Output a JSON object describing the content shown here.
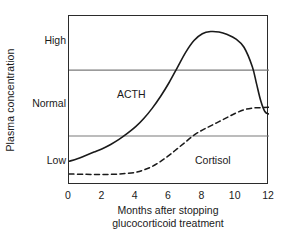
{
  "chart_data": {
    "type": "line",
    "title": "",
    "xlabel_lines": [
      "Months after stopping",
      "glucocorticoid treatment"
    ],
    "ylabel": "Plasma concentration",
    "xlim": [
      0,
      12
    ],
    "xticks": [
      0,
      2,
      4,
      6,
      8,
      10,
      12
    ],
    "xtick_labels": [
      "0",
      "2",
      "4",
      "6",
      "8",
      "10",
      "12"
    ],
    "ytick_labels": [
      "High",
      "Normal",
      "Low"
    ],
    "ytick_values": [
      0.85,
      0.5,
      0.14
    ],
    "ylim": [
      0,
      1
    ],
    "grid": "horizontal",
    "gridlines": [
      0.68,
      0.29
    ],
    "gridline_labels": [
      "upper-normal-limit",
      "lower-normal-limit"
    ],
    "legend_position": "inline-annotation",
    "series": [
      {
        "name": "ACTH",
        "style": "solid",
        "color": "#1a1a1a",
        "x": [
          0,
          0.5,
          1,
          1.5,
          2,
          2.5,
          3,
          3.5,
          4,
          4.5,
          5,
          5.5,
          6,
          6.5,
          7,
          7.5,
          8,
          8.5,
          9,
          9.5,
          10,
          10.5,
          11,
          11.25,
          11.5,
          11.75,
          12
        ],
        "y": [
          0.14,
          0.155,
          0.175,
          0.195,
          0.215,
          0.24,
          0.27,
          0.305,
          0.345,
          0.395,
          0.455,
          0.525,
          0.605,
          0.695,
          0.785,
          0.855,
          0.895,
          0.908,
          0.905,
          0.89,
          0.865,
          0.815,
          0.7,
          0.6,
          0.5,
          0.435,
          0.42
        ]
      },
      {
        "name": "Cortisol",
        "style": "dashed",
        "color": "#1a1a1a",
        "x": [
          0,
          1,
          2,
          3,
          4,
          4.5,
          5,
          5.5,
          6,
          6.5,
          7,
          7.5,
          8,
          8.5,
          9,
          9.5,
          10,
          10.5,
          11,
          11.5,
          12
        ],
        "y": [
          0.065,
          0.063,
          0.062,
          0.065,
          0.075,
          0.09,
          0.11,
          0.14,
          0.175,
          0.215,
          0.255,
          0.295,
          0.325,
          0.35,
          0.375,
          0.4,
          0.425,
          0.445,
          0.455,
          0.458,
          0.46
        ]
      }
    ],
    "annotations": [
      {
        "text": "ACTH",
        "x": 2.9,
        "y": 0.6
      },
      {
        "text": "Cortisol",
        "x": 7.6,
        "y": 0.21
      }
    ]
  },
  "axis": {
    "y_title": "Plasma concentration",
    "y_labels": {
      "high": "High",
      "normal": "Normal",
      "low": "Low"
    },
    "x_title_line1": "Months after stopping",
    "x_title_line2": "glucocorticoid treatment"
  },
  "colors": {
    "frame": "#2b2b2b",
    "gridline": "#7a7a7a",
    "curve": "#1a1a1a",
    "background": "#ffffff",
    "text": "#1a1a1a"
  }
}
